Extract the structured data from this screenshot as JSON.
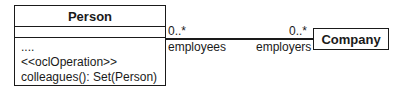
{
  "diagram": {
    "type": "uml-class",
    "classes": {
      "person": {
        "name": "Person",
        "attributes": [],
        "operations": [
          "....",
          "<<oclOperation>>",
          "colleagues(): Set(Person)"
        ]
      },
      "company": {
        "name": "Company"
      }
    },
    "association": {
      "person_end": {
        "multiplicity": "0..*",
        "role": "employees"
      },
      "company_end": {
        "multiplicity": "0..*",
        "role": "employers"
      }
    }
  }
}
